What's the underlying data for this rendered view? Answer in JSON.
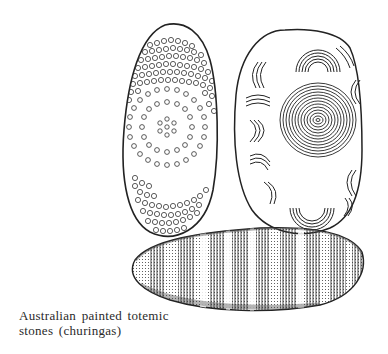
{
  "figure": {
    "caption_lines": [
      "Australian painted totemic",
      "stones (churingas)"
    ],
    "items": [
      {
        "name": "churinga-concentric-dots",
        "pattern": "concentric rings of dots"
      },
      {
        "name": "churinga-spiral-arcs",
        "pattern": "central spiral with arc motifs"
      },
      {
        "name": "churinga-striped",
        "pattern": "vertical stripes, stippled"
      }
    ],
    "ink_color": "#2a2a2a",
    "background": "#ffffff"
  }
}
